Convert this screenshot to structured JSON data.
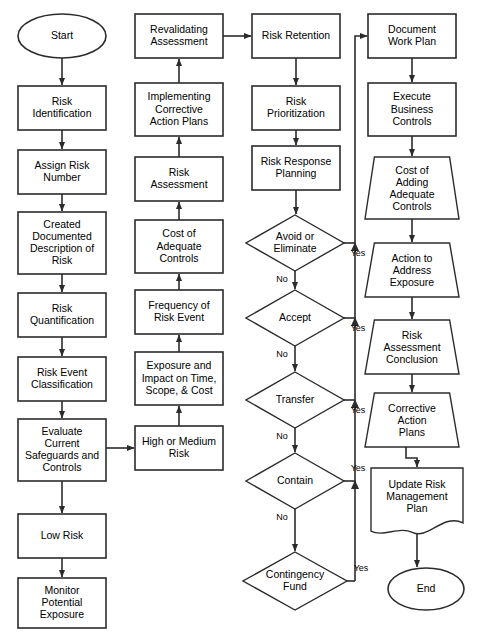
{
  "diagram": {
    "type": "flowchart",
    "background_color": "#ffffff",
    "stroke_color": "#2b2b2b",
    "fill_color": "#ffffff",
    "text_color": "#000000",
    "width": 491,
    "height": 637
  },
  "nodes": [
    {
      "id": "start",
      "shape": "ellipse",
      "label": "Start",
      "lines": [
        "Start"
      ],
      "x": 18,
      "y": 14,
      "w": 88,
      "h": 44,
      "column": 1
    },
    {
      "id": "risk-identification",
      "shape": "rect",
      "label": "Risk Identification",
      "lines": [
        "Risk",
        "Identification"
      ],
      "x": 18,
      "y": 86,
      "w": 88,
      "h": 44,
      "column": 1
    },
    {
      "id": "assign-risk-number",
      "shape": "rect",
      "label": "Assign Risk Number",
      "lines": [
        "Assign Risk",
        "Number"
      ],
      "x": 18,
      "y": 150,
      "w": 88,
      "h": 44,
      "column": 1
    },
    {
      "id": "created-documented-description",
      "shape": "rect",
      "label": "Created Documented Description of Risk",
      "lines": [
        "Created",
        "Documented",
        "Description of",
        "Risk"
      ],
      "x": 18,
      "y": 212,
      "w": 88,
      "h": 62,
      "column": 1
    },
    {
      "id": "risk-quantification",
      "shape": "rect",
      "label": "Risk Quantification",
      "lines": [
        "Risk",
        "Quantification"
      ],
      "x": 18,
      "y": 293,
      "w": 88,
      "h": 44,
      "column": 1
    },
    {
      "id": "risk-event-classification",
      "shape": "rect",
      "label": "Risk Event Classification",
      "lines": [
        "Risk Event",
        "Classification"
      ],
      "x": 18,
      "y": 357,
      "w": 88,
      "h": 44,
      "column": 1
    },
    {
      "id": "evaluate-current-safeguards",
      "shape": "rect",
      "label": "Evaluate Current Safeguards and Controls",
      "lines": [
        "Evaluate",
        "Current",
        "Safeguards and",
        "Controls"
      ],
      "x": 18,
      "y": 419,
      "w": 88,
      "h": 62,
      "column": 1
    },
    {
      "id": "low-risk",
      "shape": "rect",
      "label": "Low Risk",
      "lines": [
        "Low Risk"
      ],
      "x": 18,
      "y": 514,
      "w": 88,
      "h": 44,
      "column": 1
    },
    {
      "id": "monitor-potential-exposure",
      "shape": "rect",
      "label": "Monitor Potential Exposure",
      "lines": [
        "Monitor",
        "Potential",
        "Exposure"
      ],
      "x": 18,
      "y": 578,
      "w": 88,
      "h": 50,
      "column": 1
    },
    {
      "id": "revalidating-assessment",
      "shape": "rect",
      "label": "Revalidating Assessment",
      "lines": [
        "Revalidating",
        "Assessment"
      ],
      "x": 135,
      "y": 14,
      "w": 88,
      "h": 44,
      "column": 2
    },
    {
      "id": "implementing-corrective-action-plans",
      "shape": "rect",
      "label": "Implementing Corrective Action Plans",
      "lines": [
        "Implementing",
        "Corrective",
        "Action Plans"
      ],
      "x": 135,
      "y": 83,
      "w": 88,
      "h": 53,
      "column": 2
    },
    {
      "id": "risk-assessment",
      "shape": "rect",
      "label": "Risk Assessment",
      "lines": [
        "Risk",
        "Assessment"
      ],
      "x": 135,
      "y": 157,
      "w": 88,
      "h": 44,
      "column": 2
    },
    {
      "id": "cost-of-adequate-controls",
      "shape": "rect",
      "label": "Cost of Adequate Controls",
      "lines": [
        "Cost of",
        "Adequate",
        "Controls"
      ],
      "x": 135,
      "y": 220,
      "w": 88,
      "h": 53,
      "column": 2
    },
    {
      "id": "frequency-of-risk-event",
      "shape": "rect",
      "label": "Frequency of Risk Event",
      "lines": [
        "Frequency of",
        "Risk Event"
      ],
      "x": 135,
      "y": 290,
      "w": 88,
      "h": 44,
      "column": 2
    },
    {
      "id": "exposure-and-impact",
      "shape": "rect",
      "label": "Exposure and Impact on Time, Scope, & Cost",
      "lines": [
        "Exposure and",
        "Impact on Time,",
        "Scope, & Cost"
      ],
      "x": 135,
      "y": 352,
      "w": 88,
      "h": 53,
      "column": 2
    },
    {
      "id": "high-or-medium-risk",
      "shape": "rect",
      "label": "High or Medium Risk",
      "lines": [
        "High or Medium",
        "Risk"
      ],
      "x": 135,
      "y": 426,
      "w": 88,
      "h": 44,
      "column": 2
    },
    {
      "id": "risk-retention",
      "shape": "rect",
      "label": "Risk Retention",
      "lines": [
        "Risk Retention"
      ],
      "x": 252,
      "y": 14,
      "w": 88,
      "h": 44,
      "column": 3
    },
    {
      "id": "risk-prioritization",
      "shape": "rect",
      "label": "Risk Prioritization",
      "lines": [
        "Risk",
        "Prioritization"
      ],
      "x": 252,
      "y": 86,
      "w": 88,
      "h": 44,
      "column": 3
    },
    {
      "id": "risk-response-planning",
      "shape": "rect",
      "label": "Risk Response Planning",
      "lines": [
        "Risk Response",
        "Planning"
      ],
      "x": 252,
      "y": 146,
      "w": 88,
      "h": 44,
      "column": 3
    },
    {
      "id": "avoid-or-eliminate",
      "shape": "diamond",
      "label": "Avoid or Eliminate",
      "lines": [
        "Avoid or",
        "Eliminate"
      ],
      "x": 246,
      "y": 215,
      "w": 98,
      "h": 56,
      "column": 3
    },
    {
      "id": "accept",
      "shape": "diamond",
      "label": "Accept",
      "lines": [
        "Accept"
      ],
      "x": 246,
      "y": 290,
      "w": 98,
      "h": 56,
      "column": 3
    },
    {
      "id": "transfer",
      "shape": "diamond",
      "label": "Transfer",
      "lines": [
        "Transfer"
      ],
      "x": 246,
      "y": 372,
      "w": 98,
      "h": 56,
      "column": 3
    },
    {
      "id": "contain",
      "shape": "diamond",
      "label": "Contain",
      "lines": [
        "Contain"
      ],
      "x": 246,
      "y": 453,
      "w": 98,
      "h": 56,
      "column": 3
    },
    {
      "id": "contingency-fund",
      "shape": "diamond",
      "label": "Contingency Fund",
      "lines": [
        "Contingency",
        "Fund"
      ],
      "x": 243,
      "y": 552,
      "w": 104,
      "h": 58,
      "column": 3
    },
    {
      "id": "document-work-plan",
      "shape": "rect",
      "label": "Document Work Plan",
      "lines": [
        "Document",
        "Work Plan"
      ],
      "x": 368,
      "y": 14,
      "w": 88,
      "h": 44,
      "column": 4
    },
    {
      "id": "execute-business-controls",
      "shape": "rect",
      "label": "Execute Business Controls",
      "lines": [
        "Execute",
        "Business",
        "Controls"
      ],
      "x": 368,
      "y": 83,
      "w": 88,
      "h": 53,
      "column": 4
    },
    {
      "id": "cost-of-adding-adequate-controls",
      "shape": "trapezoid",
      "label": "Cost of Adding Adequate Controls",
      "lines": [
        "Cost of",
        "Adding",
        "Adequate",
        "Controls"
      ],
      "x": 365,
      "y": 157,
      "w": 94,
      "h": 62,
      "column": 4
    },
    {
      "id": "action-to-address-exposure",
      "shape": "trapezoid",
      "label": "Action to Address Exposure",
      "lines": [
        "Action to",
        "Address",
        "Exposure"
      ],
      "x": 365,
      "y": 243,
      "w": 94,
      "h": 54,
      "column": 4
    },
    {
      "id": "risk-assessment-conclusion",
      "shape": "trapezoid",
      "label": "Risk Assessment Conclusion",
      "lines": [
        "Risk",
        "Assessment",
        "Conclusion"
      ],
      "x": 365,
      "y": 320,
      "w": 94,
      "h": 54,
      "column": 4
    },
    {
      "id": "corrective-action-plans",
      "shape": "trapezoid",
      "label": "Corrective Action Plans",
      "lines": [
        "Corrective",
        "Action",
        "Plans"
      ],
      "x": 365,
      "y": 393,
      "w": 94,
      "h": 54,
      "column": 4
    },
    {
      "id": "update-risk-management-plan",
      "shape": "document",
      "label": "Update Risk Management Plan",
      "lines": [
        "Update Risk",
        "Management",
        "Plan"
      ],
      "x": 371,
      "y": 468,
      "w": 92,
      "h": 66,
      "column": 4
    },
    {
      "id": "end",
      "shape": "ellipse",
      "label": "End",
      "lines": [
        "End"
      ],
      "x": 388,
      "y": 568,
      "w": 76,
      "h": 42,
      "column": 4
    }
  ],
  "edges": [
    {
      "id": "e-start-riskid",
      "from": "start",
      "to": "risk-identification",
      "label": ""
    },
    {
      "id": "e-riskid-assign",
      "from": "risk-identification",
      "to": "assign-risk-number",
      "label": ""
    },
    {
      "id": "e-assign-created",
      "from": "assign-risk-number",
      "to": "created-documented-description",
      "label": ""
    },
    {
      "id": "e-created-quant",
      "from": "created-documented-description",
      "to": "risk-quantification",
      "label": ""
    },
    {
      "id": "e-quant-classif",
      "from": "risk-quantification",
      "to": "risk-event-classification",
      "label": ""
    },
    {
      "id": "e-classif-evaluate",
      "from": "risk-event-classification",
      "to": "evaluate-current-safeguards",
      "label": ""
    },
    {
      "id": "e-evaluate-low",
      "from": "evaluate-current-safeguards",
      "to": "low-risk",
      "label": ""
    },
    {
      "id": "e-low-monitor",
      "from": "low-risk",
      "to": "monitor-potential-exposure",
      "label": ""
    },
    {
      "id": "e-evaluate-highmed",
      "from": "evaluate-current-safeguards",
      "to": "high-or-medium-risk",
      "label": ""
    },
    {
      "id": "e-highmed-exposure",
      "from": "high-or-medium-risk",
      "to": "exposure-and-impact",
      "label": ""
    },
    {
      "id": "e-exposure-frequency",
      "from": "exposure-and-impact",
      "to": "frequency-of-risk-event",
      "label": ""
    },
    {
      "id": "e-frequency-cost",
      "from": "frequency-of-risk-event",
      "to": "cost-of-adequate-controls",
      "label": ""
    },
    {
      "id": "e-cost-assessment",
      "from": "cost-of-adequate-controls",
      "to": "risk-assessment",
      "label": ""
    },
    {
      "id": "e-assessment-implement",
      "from": "risk-assessment",
      "to": "implementing-corrective-action-plans",
      "label": ""
    },
    {
      "id": "e-implement-reval",
      "from": "implementing-corrective-action-plans",
      "to": "revalidating-assessment",
      "label": ""
    },
    {
      "id": "e-reval-retention",
      "from": "revalidating-assessment",
      "to": "risk-retention",
      "label": ""
    },
    {
      "id": "e-retention-prior",
      "from": "risk-retention",
      "to": "risk-prioritization",
      "label": ""
    },
    {
      "id": "e-prior-response",
      "from": "risk-prioritization",
      "to": "risk-response-planning",
      "label": ""
    },
    {
      "id": "e-response-avoid",
      "from": "risk-response-planning",
      "to": "avoid-or-eliminate",
      "label": ""
    },
    {
      "id": "e-avoid-no-accept",
      "from": "avoid-or-eliminate",
      "to": "accept",
      "label": "No"
    },
    {
      "id": "e-avoid-yes-bus",
      "from": "avoid-or-eliminate",
      "to": "document-work-plan",
      "label": "Yes"
    },
    {
      "id": "e-accept-no-transfer",
      "from": "accept",
      "to": "transfer",
      "label": "No"
    },
    {
      "id": "e-accept-yes-bus",
      "from": "accept",
      "to": "document-work-plan",
      "label": "Yes"
    },
    {
      "id": "e-transfer-no-contain",
      "from": "transfer",
      "to": "contain",
      "label": "No"
    },
    {
      "id": "e-transfer-yes-bus",
      "from": "transfer",
      "to": "document-work-plan",
      "label": "Yes"
    },
    {
      "id": "e-contain-no-conting",
      "from": "contain",
      "to": "contingency-fund",
      "label": "No"
    },
    {
      "id": "e-contain-yes-bus",
      "from": "contain",
      "to": "document-work-plan",
      "label": "Yes"
    },
    {
      "id": "e-conting-yes-bus",
      "from": "contingency-fund",
      "to": "document-work-plan",
      "label": "Yes"
    },
    {
      "id": "e-docplan-execute",
      "from": "document-work-plan",
      "to": "execute-business-controls",
      "label": ""
    },
    {
      "id": "e-execute-costadd",
      "from": "execute-business-controls",
      "to": "cost-of-adding-adequate-controls",
      "label": ""
    },
    {
      "id": "e-costadd-action",
      "from": "cost-of-adding-adequate-controls",
      "to": "action-to-address-exposure",
      "label": ""
    },
    {
      "id": "e-action-conclusion",
      "from": "action-to-address-exposure",
      "to": "risk-assessment-conclusion",
      "label": ""
    },
    {
      "id": "e-conclusion-corrective",
      "from": "risk-assessment-conclusion",
      "to": "corrective-action-plans",
      "label": ""
    },
    {
      "id": "e-corrective-update",
      "from": "corrective-action-plans",
      "to": "update-risk-management-plan",
      "label": ""
    },
    {
      "id": "e-update-end",
      "from": "update-risk-management-plan",
      "to": "end",
      "label": ""
    }
  ],
  "edge_labels": {
    "yes": "Yes",
    "no": "No"
  }
}
